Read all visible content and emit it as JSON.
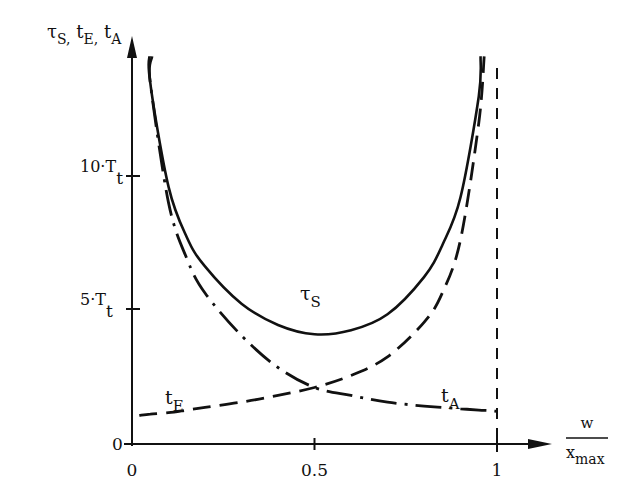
{
  "chart_data": {
    "type": "line",
    "title": "",
    "ylabel": {
      "main": "τ",
      "sub": "S",
      "rest": [
        {
          "main": "t",
          "sub": "E"
        },
        {
          "main": "t",
          "sub": "A"
        }
      ]
    },
    "ylabel_text": "τS, tE, tA",
    "xlabel": {
      "numerator": "w",
      "denominator": "x",
      "denominator_sub": "max"
    },
    "xlabel_text": "w / x_max",
    "x_ticks": [
      {
        "value": 0,
        "label": "0"
      },
      {
        "value": 0.5,
        "label": "0.5"
      },
      {
        "value": 1,
        "label": "1"
      }
    ],
    "y_ticks": [
      {
        "value": 0,
        "label": "0"
      },
      {
        "value": 5,
        "label": "5·T",
        "sub": "t"
      },
      {
        "value": 10,
        "label": "10·T",
        "sub": "t"
      }
    ],
    "y_unit": "T_t",
    "xlim": [
      0,
      1.1
    ],
    "ylim": [
      0,
      14
    ],
    "grid": false,
    "legend": "inline labels",
    "asymptote": {
      "x": 1,
      "style": "dashed vertical"
    },
    "x": [
      0.02,
      0.05,
      0.1,
      0.15,
      0.2,
      0.3,
      0.4,
      0.5,
      0.6,
      0.7,
      0.8,
      0.85,
      0.9,
      0.95,
      0.98,
      1.0
    ],
    "series": [
      {
        "name": "τS",
        "label": {
          "main": "τ",
          "sub": "S"
        },
        "style": "solid",
        "values": [
          null,
          13.5,
          9.6,
          7.7,
          6.6,
          5.2,
          4.4,
          4.05,
          4.2,
          4.8,
          6.2,
          7.4,
          9.2,
          13.0,
          null,
          null
        ]
      },
      {
        "name": "tE",
        "label": {
          "main": "t",
          "sub": "E"
        },
        "style": "dashed",
        "values": [
          1.0,
          1.05,
          1.1,
          1.2,
          1.3,
          1.5,
          1.75,
          2.05,
          2.5,
          3.2,
          4.5,
          5.6,
          7.6,
          12.0,
          null,
          null
        ]
      },
      {
        "name": "tA",
        "label": {
          "main": "t",
          "sub": "A"
        },
        "style": "dash-dot",
        "values": [
          null,
          13.5,
          9.0,
          6.9,
          5.6,
          4.0,
          2.8,
          2.05,
          1.75,
          1.5,
          1.35,
          1.3,
          1.25,
          1.2,
          1.18,
          1.15
        ]
      }
    ]
  }
}
